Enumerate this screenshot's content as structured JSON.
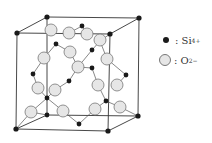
{
  "diagram": {
    "type": "crystal-structure-unit-cell",
    "legend": [
      {
        "symbol": "filled-small-circle",
        "label": ": Si",
        "charge": "4+"
      },
      {
        "symbol": "open-large-circle",
        "label": ": O",
        "charge": "2−"
      }
    ],
    "colors": {
      "si": "#1a1a1a",
      "o_fill": "#e6e6e6",
      "o_stroke": "#777777",
      "line": "#333333"
    }
  }
}
